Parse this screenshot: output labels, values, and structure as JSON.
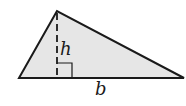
{
  "diagram": {
    "shape": "triangle",
    "labels": {
      "height": "h",
      "base": "b"
    },
    "colors": {
      "fill": "#e6e6e6",
      "stroke": "#1a1a1a",
      "background": "#ffffff"
    },
    "vertices": {
      "apex": [
        57,
        11
      ],
      "base_left": [
        19,
        78
      ],
      "base_right": [
        184,
        78
      ]
    },
    "height_line": {
      "style": "dashed",
      "x": 57,
      "y_top": 11,
      "y_bottom": 78
    },
    "right_angle_marker": {
      "x": 57,
      "y": 63,
      "size": 15
    }
  }
}
